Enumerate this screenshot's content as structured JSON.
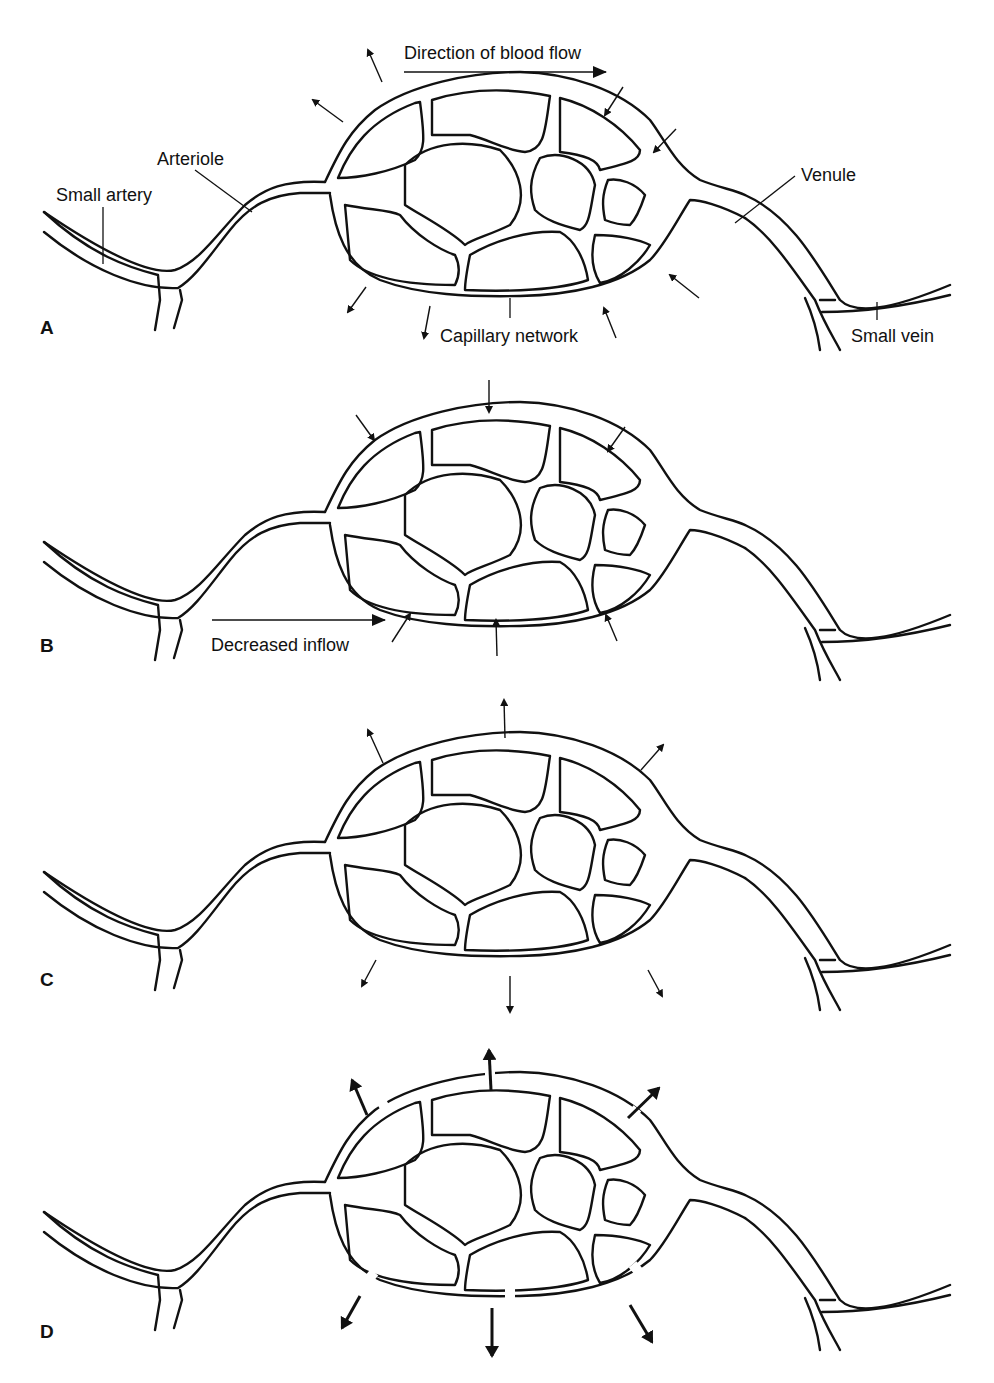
{
  "figure": {
    "colors": {
      "line": "#111111",
      "background": "#ffffff"
    },
    "panels": [
      {
        "letter": "A",
        "labels": {
          "direction": "Direction of blood flow",
          "small_artery": "Small artery",
          "arteriole": "Arteriole",
          "venule": "Venule",
          "capillary_network": "Capillary network",
          "small_vein": "Small vein"
        },
        "arrows": "outward on arterial side, inward on venous side"
      },
      {
        "letter": "B",
        "labels": {
          "inflow": "Decreased inflow"
        },
        "arrows": "all inward (thin)"
      },
      {
        "letter": "C",
        "arrows": "all outward (thin)"
      },
      {
        "letter": "D",
        "arrows": "all outward (bold), gaps in vessel wall"
      }
    ]
  }
}
